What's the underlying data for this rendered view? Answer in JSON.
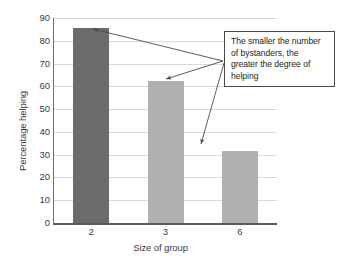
{
  "chart_data": {
    "type": "bar",
    "title": "",
    "categories": [
      "2",
      "3",
      "6"
    ],
    "values": [
      85.5,
      62.5,
      31.5
    ],
    "xlabel": "Size of group",
    "ylabel": "Percentage helping",
    "ylim": [
      0,
      90
    ],
    "ytick_labels": [
      "0",
      "10",
      "20",
      "30",
      "40",
      "50",
      "60",
      "70",
      "80",
      "90"
    ],
    "ytick_values": [
      0,
      10,
      20,
      30,
      40,
      50,
      60,
      70,
      80,
      90
    ],
    "ystep": 10,
    "grid": "horizontal",
    "legend": "none",
    "bar_colors": [
      "#6b6b6b",
      "#b0b0b0",
      "#b0b0b0"
    ],
    "annotations": [
      {
        "text": "The smaller the number of bystanders, the greater the degree of helping",
        "points_to": [
          "2",
          "3",
          "6"
        ]
      }
    ]
  },
  "callout": {
    "line1": "The smaller the number",
    "line2": "of bystanders, the",
    "line3": "greater the degree of",
    "line4": "helping"
  },
  "colors": {
    "bar_dark": "#6b6b6b",
    "bar_light": "#b0b0b0",
    "grid": "#d9d9d9",
    "axis": "#5a5a5a",
    "text": "#3a3a3a",
    "callout_border": "#4a4a4a",
    "arrow": "#4a4a4a"
  }
}
